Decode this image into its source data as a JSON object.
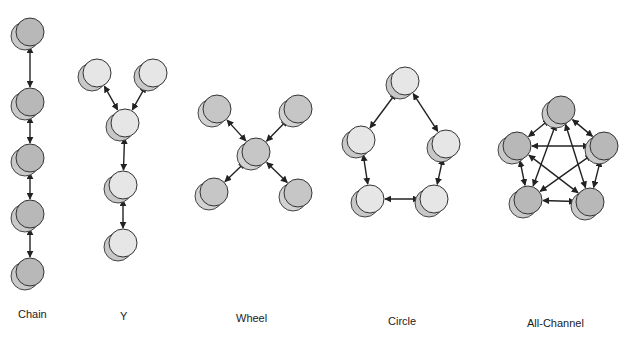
{
  "figure": {
    "title_partial": "Common Communication Networks",
    "colors": {
      "dark_fill": "#b8b8b8",
      "dark_shadow": "#c9c9c9",
      "mid_fill": "#c6c6c6",
      "mid_shadow": "#d2d2d2",
      "light_fill": "#e6e6e6",
      "light_shadow": "#c8c8c8",
      "stroke": "#333333",
      "arrow": "#222222"
    },
    "node_radius": 14,
    "networks": [
      {
        "id": "chain",
        "label": "Chain",
        "label_pos": [
          18,
          318
        ],
        "shade": "dark",
        "nodes": [
          [
            30,
            32
          ],
          [
            30,
            102
          ],
          [
            30,
            158
          ],
          [
            30,
            214
          ],
          [
            30,
            272
          ]
        ],
        "edges": [
          [
            0,
            1
          ],
          [
            1,
            2
          ],
          [
            2,
            3
          ],
          [
            3,
            4
          ]
        ]
      },
      {
        "id": "y",
        "label": "Y",
        "label_pos": [
          120,
          320
        ],
        "shade": "light",
        "nodes": [
          [
            97,
            73
          ],
          [
            153,
            73
          ],
          [
            125,
            123
          ],
          [
            123,
            185
          ],
          [
            123,
            243
          ]
        ],
        "edges": [
          [
            0,
            2
          ],
          [
            1,
            2
          ],
          [
            2,
            3
          ],
          [
            3,
            4
          ]
        ]
      },
      {
        "id": "wheel",
        "label": "Wheel",
        "label_pos": [
          236,
          322
        ],
        "shade": "mid",
        "nodes": [
          [
            217,
            109
          ],
          [
            298,
            109
          ],
          [
            256,
            152
          ],
          [
            214,
            192
          ],
          [
            298,
            193
          ]
        ],
        "edges": [
          [
            0,
            2
          ],
          [
            1,
            2
          ],
          [
            3,
            2
          ],
          [
            4,
            2
          ]
        ]
      },
      {
        "id": "circle",
        "label": "Circle",
        "label_pos": [
          388,
          325
        ],
        "shade": "light",
        "nodes": [
          [
            405,
            81
          ],
          [
            361,
            140
          ],
          [
            446,
            144
          ],
          [
            370,
            199
          ],
          [
            434,
            199
          ]
        ],
        "edges": [
          [
            0,
            1
          ],
          [
            0,
            2
          ],
          [
            1,
            3
          ],
          [
            2,
            4
          ],
          [
            3,
            4
          ]
        ]
      },
      {
        "id": "all-channel",
        "label": "All-Channel",
        "label_pos": [
          527,
          327
        ],
        "shade": "dark",
        "nodes": [
          [
            561,
            110
          ],
          [
            517,
            146
          ],
          [
            604,
            146
          ],
          [
            528,
            200
          ],
          [
            590,
            202
          ]
        ],
        "edges": [
          [
            0,
            1
          ],
          [
            0,
            2
          ],
          [
            0,
            3
          ],
          [
            0,
            4
          ],
          [
            1,
            2
          ],
          [
            1,
            3
          ],
          [
            1,
            4
          ],
          [
            2,
            3
          ],
          [
            2,
            4
          ],
          [
            3,
            4
          ]
        ]
      }
    ]
  }
}
